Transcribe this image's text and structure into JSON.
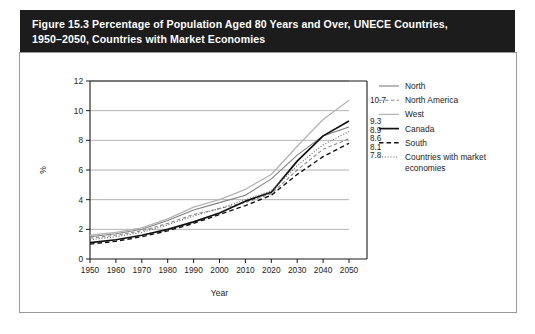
{
  "figure": {
    "title": "Figure 15.3 Percentage of Population Aged 80 Years and Over, UNECE Countries,\n1950–2050, Countries with Market Economies",
    "title_bg": "#1c1c1c",
    "title_color": "#ffffff"
  },
  "chart_data": {
    "type": "line",
    "title": "",
    "xlabel": "Year",
    "ylabel": "%",
    "xlim": [
      1950,
      2050
    ],
    "ylim": [
      0,
      12
    ],
    "ytick_step": 2,
    "grid": "horizontal",
    "legend_position": "right",
    "x": [
      1950,
      1960,
      1970,
      1980,
      1990,
      2000,
      2010,
      2020,
      2030,
      2040,
      2050
    ],
    "xticklabels": [
      "1950",
      "1960",
      "1970",
      "1980",
      "1990",
      "2000",
      "2010",
      "2020",
      "2030",
      "2040",
      "2050"
    ],
    "yticklabels": [
      "0",
      "2",
      "4",
      "6",
      "8",
      "10",
      "12"
    ],
    "series": [
      {
        "name": "North",
        "color": "#808080",
        "style": "solid",
        "width": 1.1,
        "values": [
          1.5,
          1.7,
          2.0,
          2.6,
          3.3,
          3.8,
          4.3,
          5.4,
          7.0,
          8.3,
          8.9
        ],
        "end_label": "8.9"
      },
      {
        "name": "North America",
        "color": "#8a8a8a",
        "style": "dashed",
        "width": 1.1,
        "values": [
          1.4,
          1.6,
          1.9,
          2.4,
          3.0,
          3.4,
          3.8,
          4.4,
          6.0,
          7.4,
          8.1
        ],
        "end_label": "8.1"
      },
      {
        "name": "West",
        "color": "#b4b4b4",
        "style": "solid",
        "width": 1.3,
        "values": [
          1.6,
          1.8,
          2.1,
          2.7,
          3.5,
          4.0,
          4.7,
          5.7,
          7.6,
          9.4,
          10.7
        ],
        "end_label": "10.7"
      },
      {
        "name": "Canada",
        "color": "#111111",
        "style": "solid",
        "width": 1.7,
        "values": [
          1.1,
          1.3,
          1.6,
          2.0,
          2.5,
          3.1,
          3.9,
          4.5,
          6.6,
          8.3,
          9.3
        ],
        "end_label": "9.3"
      },
      {
        "name": "South",
        "color": "#111111",
        "style": "dashed",
        "width": 1.4,
        "values": [
          1.0,
          1.2,
          1.5,
          1.9,
          2.4,
          3.0,
          3.6,
          4.3,
          5.7,
          6.9,
          7.8
        ],
        "end_label": "7.8"
      },
      {
        "name": "Countries with market economies",
        "color": "#6e6e6e",
        "style": "dotted",
        "width": 1.1,
        "values": [
          1.3,
          1.5,
          1.8,
          2.3,
          2.9,
          3.4,
          4.0,
          4.6,
          6.3,
          7.7,
          8.6
        ],
        "end_label": "8.6"
      }
    ]
  }
}
